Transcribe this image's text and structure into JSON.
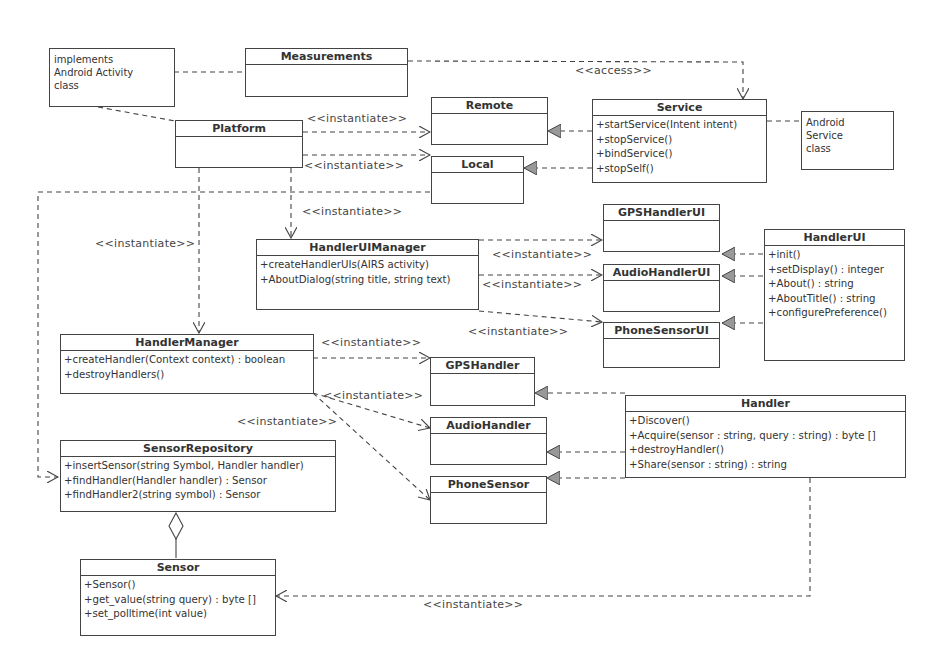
{
  "diagram": {
    "type": "UML class diagram",
    "notes": {
      "activity": "implements Android Activity class",
      "activity_lines": [
        "implements",
        "Android Activity",
        "class"
      ],
      "service_lines": [
        "Android",
        "Service",
        "class"
      ]
    },
    "classes": {
      "measurements": {
        "name": "Measurements",
        "ops": []
      },
      "platform": {
        "name": "Platform",
        "ops": []
      },
      "remote": {
        "name": "Remote",
        "ops": []
      },
      "local": {
        "name": "Local",
        "ops": []
      },
      "service": {
        "name": "Service",
        "ops": [
          "+startService(Intent intent)",
          "+stopService()",
          "+bindService()",
          "+stopSelf()"
        ]
      },
      "handler_ui_manager": {
        "name": "HandlerUIManager",
        "ops": [
          "+createHandlerUIs(AIRS activity)",
          "+AboutDialog(string title, string text)"
        ]
      },
      "gps_handler_ui": {
        "name": "GPSHandlerUI",
        "ops": []
      },
      "audio_handler_ui": {
        "name": "AudioHandlerUI",
        "ops": []
      },
      "phone_sensor_ui": {
        "name": "PhoneSensorUI",
        "ops": []
      },
      "handler_ui": {
        "name": "HandlerUI",
        "ops": [
          "+init()",
          "+setDisplay() : integer",
          "+About() : string",
          "+AboutTitle() : string",
          "+configurePreference()"
        ]
      },
      "handler_manager": {
        "name": "HandlerManager",
        "ops": [
          "+createHandler(Context context) : boolean",
          "+destroyHandlers()"
        ]
      },
      "gps_handler": {
        "name": "GPSHandler",
        "ops": []
      },
      "audio_handler": {
        "name": "AudioHandler",
        "ops": []
      },
      "phone_sensor": {
        "name": "PhoneSensor",
        "ops": []
      },
      "handler": {
        "name": "Handler",
        "ops": [
          "+Discover()",
          "+Acquire(sensor : string, query : string) : byte []",
          "+destroyHandler()",
          "+Share(sensor : string) : string"
        ]
      },
      "sensor_repository": {
        "name": "SensorRepository",
        "ops": [
          "+insertSensor(string Symbol, Handler handler)",
          "+findHandler(Handler handler) : Sensor",
          "+findHandler2(string symbol) : Sensor"
        ]
      },
      "sensor": {
        "name": "Sensor",
        "ops": [
          "+Sensor()",
          "+get_value(string query) : byte []",
          "+set_polltime(int value)"
        ]
      }
    },
    "labels": {
      "access": "<<access>>",
      "instantiate": "<<instantiate>>"
    },
    "colors": {
      "line": "#444444",
      "realization_fill": "#999999",
      "background": "#ffffff"
    }
  }
}
